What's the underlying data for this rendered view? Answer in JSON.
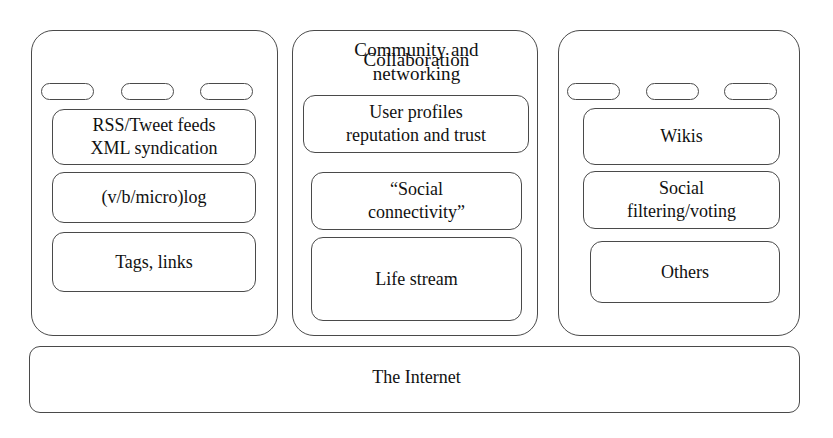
{
  "diagram": {
    "title_implicit": "Social software / Web 2.0 building blocks",
    "stroke_color": "#4a4a4a",
    "fill_color": "#ffffff",
    "text_color": "#111111"
  },
  "columns": [
    {
      "id": "communication",
      "title": "Communication",
      "has_pills": true,
      "pill_count": 3,
      "boxes": [
        {
          "id": "rss",
          "label": "RSS/Tweet feeds\nXML syndication"
        },
        {
          "id": "vblog",
          "label": "(v/b/micro)log"
        },
        {
          "id": "tags",
          "label": "Tags, links"
        }
      ]
    },
    {
      "id": "community",
      "title": "Community and\nnetworking",
      "has_pills": false,
      "pill_count": 0,
      "boxes": [
        {
          "id": "userprofiles",
          "label": "User profiles\nreputation and trust"
        },
        {
          "id": "socialconn",
          "label": "“Social\nconnectivity”"
        },
        {
          "id": "lifestream",
          "label": "Life stream"
        }
      ]
    },
    {
      "id": "collaboration",
      "title": "Collaboration",
      "has_pills": true,
      "pill_count": 3,
      "boxes": [
        {
          "id": "wikis",
          "label": "Wikis"
        },
        {
          "id": "filtering",
          "label": "Social\nfiltering/voting"
        },
        {
          "id": "others",
          "label": "Others"
        }
      ]
    }
  ],
  "foundation": {
    "label": "The Internet"
  }
}
